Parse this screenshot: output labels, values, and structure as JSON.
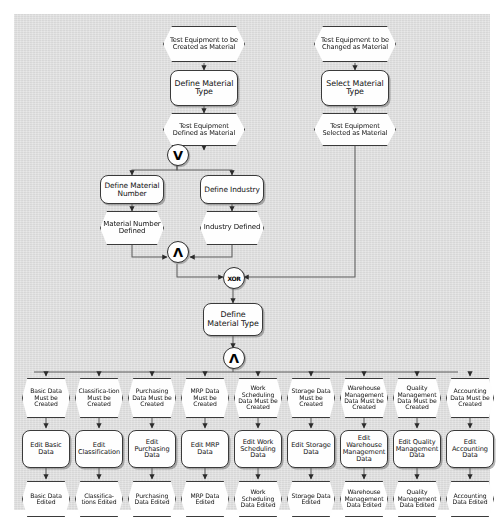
{
  "diagram": {
    "type": "epc-event-driven-process-chain",
    "background_color": "#dcdcdc",
    "node_fill": "#fefefe",
    "node_stroke": "#3a3a3a"
  },
  "connectors": [
    {
      "id": "or1",
      "kind": "OR",
      "glyph": "V",
      "x": 177,
      "y": 154
    },
    {
      "id": "and1",
      "kind": "AND",
      "glyph": "Λ",
      "x": 177,
      "y": 251
    },
    {
      "id": "xor1",
      "kind": "XOR",
      "glyph": "XOR",
      "x": 233,
      "y": 277
    },
    {
      "id": "and2",
      "kind": "AND",
      "glyph": "Λ",
      "x": 233,
      "y": 357
    }
  ],
  "top_left_branch": {
    "start_event": "Test Equipment to be Created as Material",
    "function": "Define Material Type",
    "result_event": "Test Equipment Defined as Material"
  },
  "top_right_branch": {
    "start_event": "Test Equipment to be Changed as Material",
    "function": "Select Material Type",
    "result_event": "Test Equipment Selected as Material"
  },
  "middle": {
    "left_function": "Define Material Number",
    "left_event": "Material Number Defined",
    "right_function": "Define Industry",
    "right_event": "Industry Defined",
    "main_function": "Define Material Type"
  },
  "columns": [
    {
      "event_must": "Basic Data Must be Created",
      "function": "Edit Basic Data",
      "event_done": "Basic Data Edited"
    },
    {
      "event_must": "Classifica-tion Must be Created",
      "function": "Edit Classification",
      "event_done": "Classifica-tions Edited"
    },
    {
      "event_must": "Purchasing Data Must be Created",
      "function": "Edit Purchasing Data",
      "event_done": "Purchasing Data Edited"
    },
    {
      "event_must": "MRP Data Must be Created",
      "function": "Edit MRP Data",
      "event_done": "MRP Data Edited"
    },
    {
      "event_must": "Work Scheduling Data Must be Created",
      "function": "Edit Work Scheduling Data",
      "event_done": "Work Scheduling Data Edited"
    },
    {
      "event_must": "Storage Data Must be Created",
      "function": "Edit Storage Data",
      "event_done": "Storage Data Edited"
    },
    {
      "event_must": "Warehouse Management Data Must be Created",
      "function": "Edit Warehouse Management Data",
      "event_done": "Warehouse Management Data Edited"
    },
    {
      "event_must": "Quality Management Data Must be Created",
      "function": "Edit Quality Management Data",
      "event_done": "Quality Management Data Edited"
    },
    {
      "event_must": "Accounting Data Must be Created",
      "function": "Edit Accounting Data",
      "event_done": "Accounting Data Edited"
    }
  ]
}
